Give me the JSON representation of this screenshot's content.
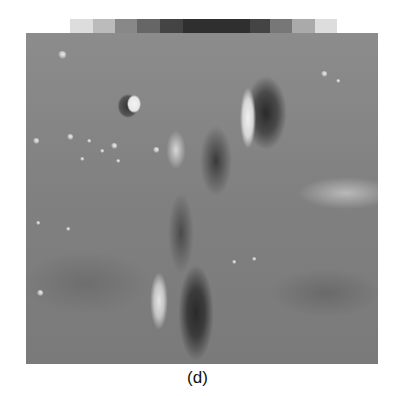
{
  "figure": {
    "caption": "(d)",
    "gray_strip": {
      "segments": [
        {
          "width": 23,
          "color": "#dddddd"
        },
        {
          "width": 22,
          "color": "#bbbbbb"
        },
        {
          "width": 22,
          "color": "#888888"
        },
        {
          "width": 23,
          "color": "#666666"
        },
        {
          "width": 23,
          "color": "#444444"
        },
        {
          "width": 67,
          "color": "#2f2f2f"
        },
        {
          "width": 20,
          "color": "#444444"
        },
        {
          "width": 22,
          "color": "#777777"
        },
        {
          "width": 23,
          "color": "#aaaaaa"
        },
        {
          "width": 22,
          "color": "#dddddd"
        }
      ]
    },
    "small_craters": [
      {
        "x": 36,
        "y": 22,
        "r": 4
      },
      {
        "x": 10,
        "y": 108,
        "r": 3
      },
      {
        "x": 44,
        "y": 104,
        "r": 3
      },
      {
        "x": 63,
        "y": 108,
        "r": 2
      },
      {
        "x": 88,
        "y": 113,
        "r": 3
      },
      {
        "x": 130,
        "y": 117,
        "r": 3
      },
      {
        "x": 92,
        "y": 128,
        "r": 2
      },
      {
        "x": 76,
        "y": 118,
        "r": 2
      },
      {
        "x": 56,
        "y": 126,
        "r": 2
      },
      {
        "x": 298,
        "y": 41,
        "r": 3
      },
      {
        "x": 312,
        "y": 48,
        "r": 2
      },
      {
        "x": 14,
        "y": 260,
        "r": 3
      },
      {
        "x": 12,
        "y": 190,
        "r": 2
      },
      {
        "x": 228,
        "y": 226,
        "r": 2
      },
      {
        "x": 208,
        "y": 229,
        "r": 2
      },
      {
        "x": 42,
        "y": 196,
        "r": 2
      }
    ]
  }
}
